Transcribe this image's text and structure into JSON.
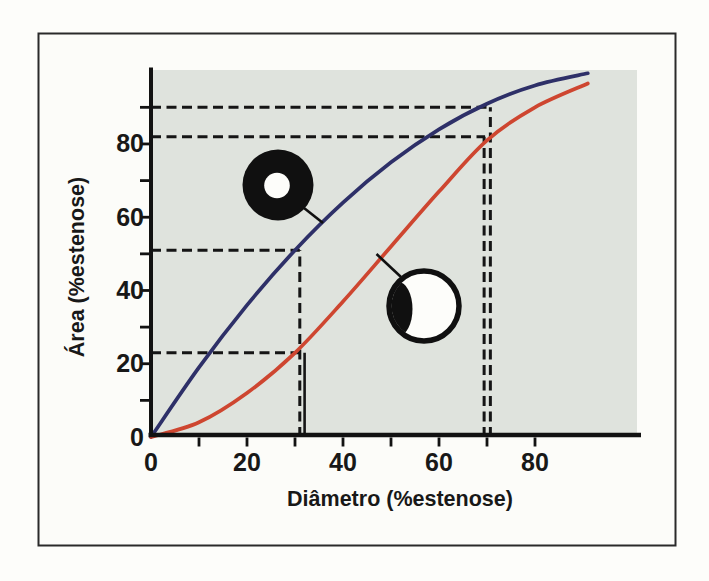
{
  "figure": {
    "frame_color": "#2a2a2a",
    "inner_background": "#fcfcf9"
  },
  "chart_data": {
    "type": "line",
    "title": "",
    "plot_background": "#dfe3dd",
    "grid": false,
    "legend": false,
    "x_axis": {
      "label": "Diâmetro (%estenose)",
      "tick_values": [
        0,
        20,
        40,
        60,
        80
      ],
      "minor_tick_values": [
        10,
        30,
        50,
        70
      ],
      "range": [
        0,
        102
      ]
    },
    "y_axis": {
      "label": "Área (%estenose)",
      "tick_values": [
        0,
        20,
        40,
        60,
        80
      ],
      "minor_tick_values": [
        10,
        30,
        50,
        70,
        90
      ],
      "range": [
        0,
        100
      ]
    },
    "series": [
      {
        "name": "concentric-stenosis-curve",
        "color": "#2e3068",
        "x": [
          0,
          10,
          20,
          30,
          40,
          50,
          60,
          70,
          80,
          91
        ],
        "y": [
          0,
          19,
          36,
          51,
          64,
          75,
          84,
          91,
          96,
          99.3
        ]
      },
      {
        "name": "eccentric-stenosis-curve",
        "color": "#ce4630",
        "x": [
          0,
          10,
          20,
          30,
          40,
          50,
          60,
          70,
          80,
          91
        ],
        "y": [
          0,
          4,
          12,
          23,
          37,
          52,
          67,
          81,
          90,
          96.5
        ]
      }
    ],
    "guides": {
      "color": "#151515",
      "dashed_horizontal": [
        {
          "y": 90,
          "x_start": 0,
          "x_end": 70.7
        },
        {
          "y": 82,
          "x_start": 0,
          "x_end": 69.6
        },
        {
          "y": 51,
          "x_start": 0,
          "x_end": 31
        },
        {
          "y": 23,
          "x_start": 0,
          "x_end": 31.7
        }
      ],
      "dashed_vertical": [
        {
          "x": 70.7,
          "y_start": 0,
          "y_end": 90
        },
        {
          "x": 69.4,
          "y_start": 0,
          "y_end": 82
        },
        {
          "x": 31,
          "y_start": 0,
          "y_end": 51
        }
      ],
      "solid_vertical": [
        {
          "x": 32,
          "y_start": 0,
          "y_end": 23
        }
      ]
    },
    "annotations": [
      {
        "name": "concentric-stenosis-icon",
        "description": "black ring with central white lumen, connected to concentric curve",
        "fill": "#101010",
        "lumen": "#fdfdfa"
      },
      {
        "name": "eccentric-stenosis-icon",
        "description": "white vessel with eccentric black plaque, connected to eccentric curve",
        "fill": "#fdfdfa",
        "plaque": "#101010"
      }
    ]
  }
}
